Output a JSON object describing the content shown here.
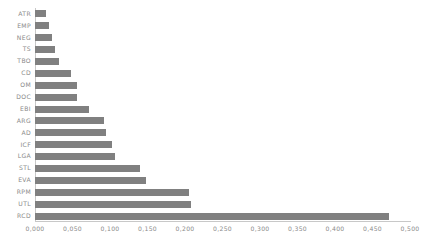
{
  "chart_data": {
    "type": "bar",
    "orientation": "horizontal",
    "title": "",
    "subtitle": "",
    "xlabel": "",
    "ylabel": "",
    "xlim": [
      0.0,
      0.5
    ],
    "ylim": null,
    "grid": false,
    "legend": null,
    "legend_position": "none",
    "decimal_separator": ",",
    "bar_color": "#808080",
    "axis_color": "#c8c8c8",
    "tick_label_color": "#8a8a8a",
    "categories": [
      "ATR",
      "EMP",
      "NEG",
      "TS",
      "TBO",
      "CD",
      "OM",
      "DOC",
      "EBI",
      "ARG",
      "AD",
      "ICF",
      "LGA",
      "STL",
      "EVA",
      "RPM",
      "UTL",
      "RCD"
    ],
    "values": [
      0.014,
      0.018,
      0.022,
      0.026,
      0.032,
      0.048,
      0.056,
      0.056,
      0.072,
      0.092,
      0.094,
      0.102,
      0.106,
      0.14,
      0.148,
      0.205,
      0.208,
      0.472
    ],
    "xticks": [
      0.0,
      0.05,
      0.1,
      0.15,
      0.2,
      0.25,
      0.3,
      0.35,
      0.4,
      0.45,
      0.5
    ],
    "xtick_labels": [
      "0,000",
      "0,050",
      "0,100",
      "0,150",
      "0,200",
      "0,250",
      "0,300",
      "0,350",
      "0,400",
      "0,450",
      "0,500"
    ],
    "ytick_labels": [
      "ATR",
      "EMP",
      "NEG",
      "TS",
      "TBO",
      "CD",
      "OM",
      "DOC",
      "EBI",
      "ARG",
      "AD",
      "ICF",
      "LGA",
      "STL",
      "EVA",
      "RPM",
      "UTL",
      "RCD"
    ]
  }
}
